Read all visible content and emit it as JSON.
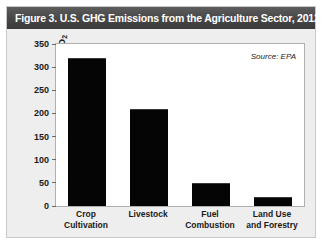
{
  "figure": {
    "title": "Figure 3. U.S. GHG Emissions from the Agriculture Sector, 2012",
    "source_note": "Source: EPA",
    "ylabel_main": "Million Tons of CO",
    "ylabel_sub": "2"
  },
  "chart_data": {
    "type": "bar",
    "title": "Figure 3. U.S. GHG Emissions from the Agriculture Sector, 2012",
    "xlabel": "",
    "ylabel": "Million Tons of CO2",
    "categories": [
      "Crop\nCultivation",
      "Livestock",
      "Fuel\nCombustion",
      "Land Use\nand Forestry"
    ],
    "category_lines": [
      [
        "Crop",
        "Cultivation"
      ],
      [
        "Livestock",
        ""
      ],
      [
        "Fuel",
        "Combustion"
      ],
      [
        "Land Use",
        "and Forestry"
      ]
    ],
    "values": [
      320,
      210,
      50,
      20
    ],
    "ylim": [
      0,
      350
    ],
    "yticks": [
      0,
      50,
      100,
      150,
      200,
      250,
      300,
      350
    ],
    "ytick_labels": [
      "0",
      "50",
      "100",
      "150",
      "200",
      "250",
      "300",
      "350"
    ],
    "grid": false,
    "legend": false,
    "annotations": [
      "Source: EPA"
    ],
    "bar_color": "#050505",
    "plot_background": "#ffffff",
    "panel_background": "#eeeeee",
    "title_background": "#4a4a4a",
    "title_color": "#ffffff"
  }
}
